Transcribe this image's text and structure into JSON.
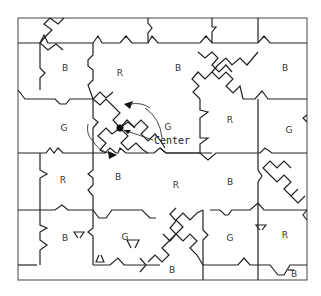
{
  "diagram": {
    "annotation": {
      "center_label": "Center"
    },
    "tile_labels": [
      {
        "text": "B",
        "x": 65,
        "y": 71
      },
      {
        "text": "R",
        "x": 120,
        "y": 76
      },
      {
        "text": "B",
        "x": 178,
        "y": 71
      },
      {
        "text": "B",
        "x": 285,
        "y": 71
      },
      {
        "text": "G",
        "x": 64,
        "y": 131
      },
      {
        "text": "G",
        "x": 168,
        "y": 130
      },
      {
        "text": "R",
        "x": 230,
        "y": 123
      },
      {
        "text": "G",
        "x": 289,
        "y": 133
      },
      {
        "text": "R",
        "x": 63,
        "y": 183
      },
      {
        "text": "B",
        "x": 118,
        "y": 180
      },
      {
        "text": "R",
        "x": 176,
        "y": 188
      },
      {
        "text": "B",
        "x": 230,
        "y": 185
      },
      {
        "text": "B",
        "x": 65,
        "y": 241
      },
      {
        "text": "G",
        "x": 125,
        "y": 240
      },
      {
        "text": "G",
        "x": 230,
        "y": 241
      },
      {
        "text": "R",
        "x": 285,
        "y": 238
      },
      {
        "text": "B",
        "x": 172,
        "y": 273
      },
      {
        "text": "B",
        "x": 294,
        "y": 277
      }
    ],
    "legend": {
      "B": "Blue tile",
      "R": "Red tile",
      "G": "Green tile"
    }
  }
}
